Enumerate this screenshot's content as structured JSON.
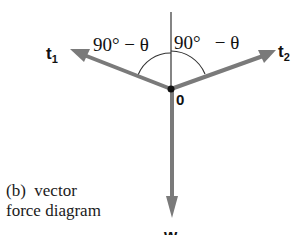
{
  "figure": {
    "caption_line1": "(b)  vector",
    "caption_line2": "force diagram"
  },
  "vectors": {
    "t1": {
      "label": "t",
      "subscript": "1"
    },
    "t2": {
      "label": "t",
      "subscript": "2"
    },
    "w": {
      "label": "w"
    }
  },
  "origin": {
    "label": "0"
  },
  "angles": {
    "left": {
      "label": "90° − θ"
    },
    "right": {
      "label": "90°   − θ"
    }
  },
  "colors": {
    "vector": "#7a7a7a",
    "line": "#333333",
    "text": "#111111"
  }
}
